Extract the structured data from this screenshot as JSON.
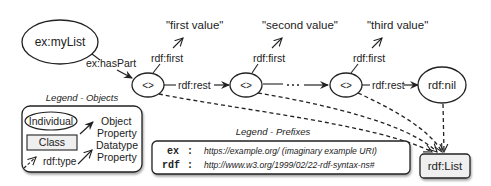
{
  "diagram": {
    "nodes": {
      "my_list": "ex:myList",
      "blank1": "<>",
      "blank2": "<>",
      "blank3": "<>",
      "nil": "rdf:nil",
      "rdf_list": "rdf:List"
    },
    "literals": {
      "first": "\"first value\"",
      "second": "\"second value\"",
      "third": "\"third value\""
    },
    "edges": {
      "has_part": "ex:hasPart",
      "first1": "rdf:first",
      "first2": "rdf:first",
      "first3": "rdf:first",
      "rest1": "rdf:rest",
      "rest3": "rdf:rest"
    }
  },
  "legend_objects": {
    "title": "Legend - Objects",
    "individual": "Individual",
    "class": "Class",
    "rdf_type": "rdf:type",
    "object_property_1": "Object",
    "object_property_2": "Property",
    "datatype_property_1": "Datatype",
    "datatype_property_2": "Property"
  },
  "legend_prefixes": {
    "title": "Legend - Prefixes",
    "rows": [
      {
        "prefix": "ex",
        "sep": ":",
        "uri": "https://example.org/ (imaginary example URI)"
      },
      {
        "prefix": "rdf",
        "sep": ":",
        "uri": "http://www.w3.org/1999/02/22-rdf-syntax-ns#"
      }
    ]
  },
  "colors": {
    "stroke": "#222222",
    "class_fill": "#efefef",
    "background": "#ffffff"
  }
}
